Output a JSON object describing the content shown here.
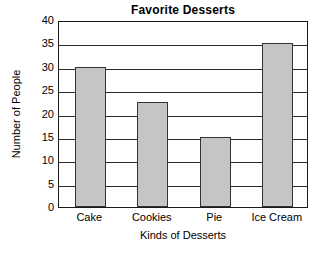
{
  "chart_data": {
    "type": "bar",
    "title": "Favorite Desserts",
    "xlabel": "Kinds of Desserts",
    "ylabel": "Number of People",
    "categories": [
      "Cake",
      "Cookies",
      "Pie",
      "Ice Cream"
    ],
    "values": [
      30,
      22.5,
      15,
      35
    ],
    "ylim": [
      0,
      40
    ],
    "ytick_labels": [
      "0",
      "5",
      "10",
      "15",
      "20",
      "25",
      "30",
      "35",
      "40"
    ],
    "ytick_values": [
      0,
      5,
      10,
      15,
      20,
      25,
      30,
      35,
      40
    ],
    "ytick_step": 5,
    "grid": "horizontal",
    "legend": "none",
    "bar_fill_color": "#c5c5c5",
    "bar_edge_color": "#333333",
    "axis_color": "#1a1a1a",
    "background_color": "#ffffff"
  }
}
